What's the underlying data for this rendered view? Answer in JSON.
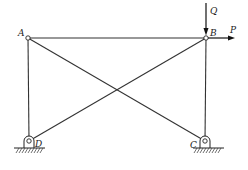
{
  "diagram": {
    "type": "truss-frame",
    "nodes": {
      "A": {
        "label": "A",
        "x": 28,
        "y": 38
      },
      "B": {
        "label": "B",
        "x": 206,
        "y": 38
      },
      "C": {
        "label": "C",
        "x": 205,
        "y": 141
      },
      "D": {
        "label": "D",
        "x": 29,
        "y": 141
      }
    },
    "members": [
      "AB",
      "AD",
      "BC",
      "AC",
      "BD"
    ],
    "supports": [
      {
        "node": "D",
        "type": "pin"
      },
      {
        "node": "C",
        "type": "pin"
      }
    ],
    "loads": {
      "Q": {
        "label": "Q",
        "direction": "down",
        "at": "B"
      },
      "P": {
        "label": "P",
        "direction": "right",
        "at": "B"
      }
    }
  },
  "colors": {
    "line": "#333333",
    "background": "#ffffff"
  }
}
